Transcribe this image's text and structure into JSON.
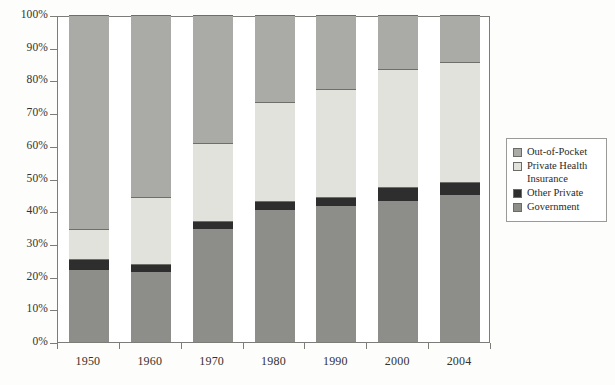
{
  "chart_data": {
    "type": "bar",
    "stacked": true,
    "stack_mode": "percent",
    "title": "",
    "subtitle": "",
    "xlabel": "",
    "ylabel": "",
    "categories": [
      "1950",
      "1960",
      "1970",
      "1980",
      "1990",
      "2000",
      "2004"
    ],
    "ylim": [
      0,
      100
    ],
    "ytick_labels": [
      "0%",
      "10%",
      "20%",
      "30%",
      "40%",
      "50%",
      "60%",
      "70%",
      "80%",
      "90%",
      "100%"
    ],
    "ytick_values": [
      0,
      10,
      20,
      30,
      40,
      50,
      60,
      70,
      80,
      90,
      100
    ],
    "grid": false,
    "legend_position": "right",
    "stack_order_bottom_to_top": [
      "Government",
      "Other Private",
      "Private Health Insurance",
      "Out-of-Pocket"
    ],
    "series": [
      {
        "name": "Government",
        "color": "#8d8d8a",
        "values": [
          22.0,
          21.5,
          34.5,
          40.5,
          41.5,
          43.0,
          45.0
        ]
      },
      {
        "name": "Other Private",
        "color": "#2e2e2e",
        "values": [
          3.5,
          2.5,
          2.5,
          2.5,
          3.0,
          4.5,
          4.0
        ]
      },
      {
        "name": "Private Health Insurance",
        "color": "#e2e2dd",
        "values": [
          9.0,
          20.5,
          24.0,
          30.5,
          33.0,
          36.0,
          36.5
        ]
      },
      {
        "name": "Out-of-Pocket",
        "color": "#aaaaa6",
        "values": [
          65.5,
          55.5,
          39.0,
          26.5,
          22.5,
          16.5,
          14.5
        ]
      }
    ],
    "cumulative_tops": {
      "1950": {
        "Government": 22.0,
        "Other Private": 25.5,
        "Private Health Insurance": 34.5,
        "Out-of-Pocket": 100
      },
      "1960": {
        "Government": 21.5,
        "Other Private": 24.0,
        "Private Health Insurance": 44.5,
        "Out-of-Pocket": 100
      },
      "1970": {
        "Government": 34.5,
        "Other Private": 37.0,
        "Private Health Insurance": 61.0,
        "Out-of-Pocket": 100
      },
      "1980": {
        "Government": 40.5,
        "Other Private": 43.0,
        "Private Health Insurance": 73.5,
        "Out-of-Pocket": 100
      },
      "1990": {
        "Government": 41.5,
        "Other Private": 44.5,
        "Private Health Insurance": 77.5,
        "Out-of-Pocket": 100
      },
      "2000": {
        "Government": 43.0,
        "Other Private": 47.5,
        "Private Health Insurance": 83.5,
        "Out-of-Pocket": 100
      },
      "2004": {
        "Government": 45.0,
        "Other Private": 49.0,
        "Private Health Insurance": 85.5,
        "Out-of-Pocket": 100
      }
    }
  },
  "legend": {
    "items": [
      {
        "label": "Out-of-Pocket",
        "color": "#aaaaa6"
      },
      {
        "label": "Private Health\nInsurance",
        "color": "#e2e2dd"
      },
      {
        "label": "Other Private",
        "color": "#2e2e2e"
      },
      {
        "label": "Government",
        "color": "#8d8d8a"
      }
    ]
  }
}
